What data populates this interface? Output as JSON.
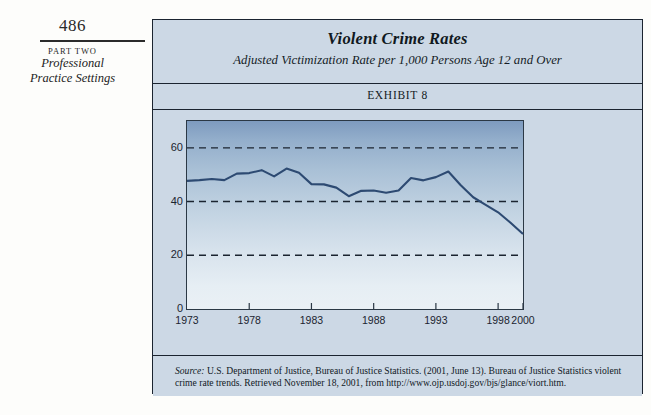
{
  "margin": {
    "page_number": "486",
    "part_label": "PART TWO",
    "part_title_line1": "Professional",
    "part_title_line2": "Practice Settings"
  },
  "exhibit": {
    "title": "Violent Crime Rates",
    "subtitle": "Adjusted Victimization Rate per 1,000 Persons Age 12 and Over",
    "exhibit_label": "EXHIBIT 8",
    "source_label": "Source:",
    "source_body": " U.S. Department of Justice, Bureau of Justice Statistics. (2001, June 13). Bureau of Justice Statistics violent crime rate trends. Retrieved November 18, 2001, from http://www.ojp.usdoj.gov/bjs/glance/viort.htm."
  },
  "colors": {
    "line": "#2d4a72",
    "frame": "#1b2430",
    "panel": "#ccd8e5",
    "plot_top": "#7e9bbf",
    "plot_bottom": "#eaf0f5",
    "gridline": "#1b2430"
  },
  "chart_data": {
    "type": "line",
    "title": "Violent Crime Rates",
    "subtitle": "Adjusted Victimization Rate per 1,000 Persons Age 12 and Over",
    "xlabel": "",
    "ylabel": "",
    "grid": true,
    "legend": "none",
    "xlim": [
      1973,
      2000
    ],
    "ylim": [
      0,
      70
    ],
    "yticks": [
      0,
      20,
      40,
      60
    ],
    "ytick_labels": [
      "0",
      "20",
      "40",
      "60"
    ],
    "gridlines_at": [
      20,
      40,
      60
    ],
    "xticks": [
      1973,
      1978,
      1983,
      1988,
      1993,
      1998,
      2000
    ],
    "xtick_labels": [
      "1973",
      "1978",
      "1983",
      "1988",
      "1993",
      "1998",
      "2000"
    ],
    "x": [
      1973,
      1974,
      1975,
      1976,
      1977,
      1978,
      1979,
      1980,
      1981,
      1982,
      1983,
      1984,
      1985,
      1986,
      1987,
      1988,
      1989,
      1990,
      1991,
      1992,
      1993,
      1994,
      1995,
      1996,
      1997,
      1998,
      1999,
      2000
    ],
    "series": [
      {
        "name": "Adjusted victimization rate per 1,000 persons age 12 and over",
        "values": [
          47.7,
          48.0,
          48.4,
          48.0,
          50.4,
          50.6,
          51.7,
          49.4,
          52.3,
          50.7,
          46.5,
          46.4,
          45.2,
          42.0,
          44.0,
          44.1,
          43.3,
          44.1,
          48.8,
          47.9,
          49.1,
          51.2,
          46.1,
          41.6,
          38.8,
          36.0,
          32.1,
          27.9
        ]
      }
    ]
  }
}
